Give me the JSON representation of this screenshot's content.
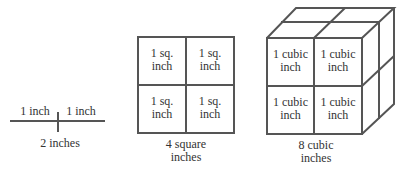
{
  "line_figure": {
    "segment_left": "1 inch",
    "segment_right": "1 inch",
    "caption": "2 inches"
  },
  "square_figure": {
    "cells": [
      {
        "line1": "1 sq.",
        "line2": "inch"
      },
      {
        "line1": "1 sq.",
        "line2": "inch"
      },
      {
        "line1": "1 sq.",
        "line2": "inch"
      },
      {
        "line1": "1 sq.",
        "line2": "inch"
      }
    ],
    "caption_line1": "4 square",
    "caption_line2": "inches"
  },
  "cube_figure": {
    "cells": [
      {
        "line1": "1 cubic",
        "line2": "inch"
      },
      {
        "line1": "1 cubic",
        "line2": "inch"
      },
      {
        "line1": "1 cubic",
        "line2": "inch"
      },
      {
        "line1": "1 cubic",
        "line2": "inch"
      }
    ],
    "caption_line1": "8 cubic",
    "caption_line2": "inches"
  },
  "colors": {
    "stroke": "#555555",
    "text": "#333333",
    "background": "#ffffff"
  }
}
